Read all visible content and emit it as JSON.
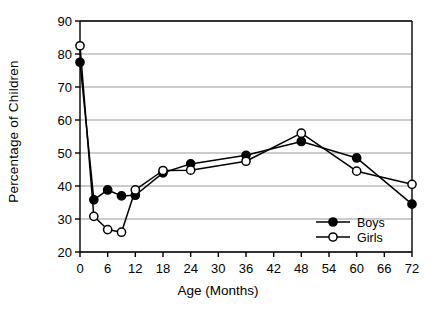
{
  "chart_data": {
    "type": "line",
    "title": "",
    "xlabel": "Age (Months)",
    "ylabel": "Percentage of Children",
    "x": [
      0,
      3,
      6,
      9,
      12,
      18,
      24,
      36,
      48,
      60,
      72
    ],
    "xlim": [
      0,
      72
    ],
    "ylim": [
      20,
      90
    ],
    "xticks": [
      0,
      6,
      12,
      18,
      24,
      30,
      36,
      42,
      48,
      54,
      60,
      66,
      72
    ],
    "yticks": [
      20,
      30,
      40,
      50,
      60,
      70,
      80,
      90
    ],
    "grid": "horizontal",
    "legend_position": "bottom-right",
    "series": [
      {
        "name": "Boys",
        "marker": "filled-circle",
        "color": "#000000",
        "values": [
          77.5,
          35.8,
          38.8,
          37.0,
          37.2,
          44.0,
          46.7,
          49.3,
          53.5,
          48.5,
          34.5
        ]
      },
      {
        "name": "Girls",
        "marker": "open-circle",
        "color": "#000000",
        "values": [
          82.5,
          30.8,
          26.8,
          26.0,
          38.8,
          44.7,
          44.8,
          47.5,
          56.0,
          44.5,
          40.5
        ]
      }
    ]
  },
  "axes": {
    "y_title": "Percentage of Children",
    "x_title": "Age (Months)",
    "y_tick_labels": [
      "90",
      "80",
      "70",
      "60",
      "50",
      "40",
      "30",
      "20"
    ],
    "x_tick_labels": [
      "0",
      "6",
      "12",
      "18",
      "24",
      "30",
      "36",
      "42",
      "48",
      "54",
      "60",
      "66",
      "72"
    ]
  },
  "legend": {
    "entries": [
      {
        "label": "Boys"
      },
      {
        "label": "Girls"
      }
    ]
  },
  "footer": {
    "cut_off_caption": ""
  }
}
